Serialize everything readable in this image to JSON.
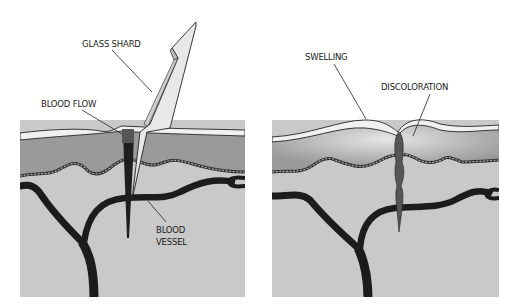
{
  "panels": [
    {
      "id": "injury",
      "labels": {
        "glass_shard": "GLASS SHARD",
        "blood_flow": "BLOOD FLOW",
        "blood_vessel_line1": "BLOOD",
        "blood_vessel_line2": "VESSEL"
      }
    },
    {
      "id": "aftermath",
      "labels": {
        "swelling": "SWELLING",
        "discoloration": "DISCOLORATION"
      }
    }
  ],
  "colors": {
    "background": "#ffffff",
    "epidermis": "#f0f0f0",
    "dermis": "#9a9a9a",
    "subcutis": "#c9c9c9",
    "vessel": "#1c1c1c",
    "glass": "#e8e8e8",
    "bruise": "#555555"
  }
}
